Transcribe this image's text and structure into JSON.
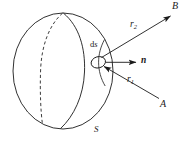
{
  "figure": {
    "labels": {
      "point_a": "A",
      "point_b": "B",
      "surface": "S",
      "element": "ds",
      "element_d": "d",
      "element_s": "s",
      "normal": "n",
      "vector_r1_base": "r",
      "vector_r1_sub": "1",
      "vector_r2_base": "r",
      "vector_r2_sub": "2"
    },
    "colors": {
      "line": "#1a1a1a",
      "background": "#ffffff"
    },
    "geometry": {
      "sphere_center_x": 63,
      "sphere_center_y": 71,
      "sphere_radius_x": 50,
      "sphere_radius_y": 58,
      "element_center_x": 98,
      "element_center_y": 62,
      "normal_tip_x": 136,
      "normal_tip_y": 62,
      "point_a_x": 162,
      "point_a_y": 101,
      "point_b_x": 173,
      "point_b_y": 13
    }
  }
}
